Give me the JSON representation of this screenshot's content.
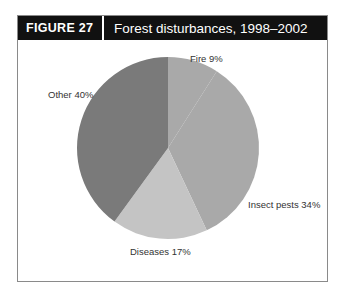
{
  "figure": {
    "label": "FIGURE  27",
    "title": "Forest disturbances, 1998–2002"
  },
  "chart_data": {
    "type": "pie",
    "title": "Forest disturbances, 1998–2002",
    "categories": [
      "Fire",
      "Insect pests",
      "Diseases",
      "Other"
    ],
    "values": [
      9,
      34,
      17,
      40
    ],
    "labels": [
      "Fire 9%",
      "Insect pests 34%",
      "Diseases 17%",
      "Other 40%"
    ],
    "colors": [
      "#a9a9a9",
      "#a9a9a9",
      "#c4c4c4",
      "#7a7a7a"
    ],
    "start_angle_deg": 0,
    "direction": "clockwise"
  }
}
